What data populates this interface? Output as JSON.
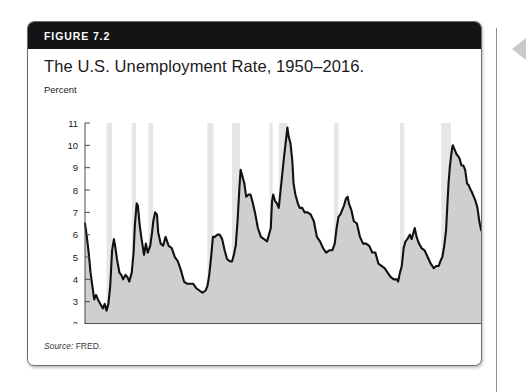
{
  "figure": {
    "badge_label": "FIGURE 7.2",
    "title": "The U.S. Unemployment Rate, 1950–2016.",
    "source_word": "Source:",
    "source_text": " FRED."
  },
  "colors": {
    "header_bar": "#141414",
    "card_border": "#6e6e6e",
    "line": "#111111",
    "area_fill": "#cfcfcf",
    "recession_band": "#e6e6e6",
    "axis": "#4a4a4a",
    "page_background": "#ffffff",
    "edge_arrow": "#c9c9c9"
  },
  "chart_data": {
    "type": "area",
    "title": "The U.S. Unemployment Rate, 1950–2016.",
    "xlabel": "Year",
    "ylabel": "Percent",
    "ylim": [
      2,
      11
    ],
    "xlim": [
      1950,
      2016
    ],
    "grid": false,
    "legend": "none",
    "ytick_labels": [
      "2",
      "3",
      "4",
      "5",
      "6",
      "7",
      "8",
      "9",
      "10",
      "11"
    ],
    "ytick_values": [
      2,
      3,
      4,
      5,
      6,
      7,
      8,
      9,
      10,
      11
    ],
    "xtick_labels": [
      "1950",
      "1960",
      "1970",
      "1980",
      "1990",
      "2000",
      "2010"
    ],
    "xtick_values": [
      1950,
      1960,
      1970,
      1980,
      1990,
      2000,
      2010
    ],
    "series": [
      {
        "name": "U.S. Unemployment Rate",
        "x": [
          1950.0,
          1950.3,
          1950.6,
          1950.9,
          1951.2,
          1951.5,
          1951.8,
          1952.1,
          1952.5,
          1952.9,
          1953.2,
          1953.5,
          1953.8,
          1954.1,
          1954.4,
          1954.7,
          1954.9,
          1955.2,
          1955.6,
          1955.9,
          1956.2,
          1956.6,
          1956.9,
          1957.2,
          1957.6,
          1957.9,
          1958.1,
          1958.4,
          1958.6,
          1958.9,
          1959.2,
          1959.6,
          1959.9,
          1960.2,
          1960.6,
          1960.9,
          1961.1,
          1961.4,
          1961.7,
          1961.9,
          1962.3,
          1962.7,
          1963.1,
          1963.6,
          1964.1,
          1964.6,
          1965.1,
          1965.6,
          1966.1,
          1966.6,
          1967.1,
          1967.6,
          1968.1,
          1968.6,
          1969.1,
          1969.6,
          1969.9,
          1970.2,
          1970.5,
          1970.8,
          1971.1,
          1971.5,
          1971.9,
          1972.3,
          1972.7,
          1973.1,
          1973.6,
          1973.9,
          1974.2,
          1974.5,
          1974.8,
          1975.1,
          1975.3,
          1975.6,
          1975.9,
          1976.2,
          1976.6,
          1976.9,
          1977.3,
          1977.7,
          1978.1,
          1978.6,
          1979.1,
          1979.6,
          1979.9,
          1980.2,
          1980.4,
          1980.6,
          1980.9,
          1981.2,
          1981.5,
          1981.8,
          1982.1,
          1982.4,
          1982.7,
          1982.9,
          1983.1,
          1983.4,
          1983.7,
          1983.9,
          1984.2,
          1984.6,
          1984.9,
          1985.3,
          1985.7,
          1986.2,
          1986.7,
          1987.2,
          1987.7,
          1988.2,
          1988.7,
          1989.2,
          1989.7,
          1990.2,
          1990.6,
          1990.9,
          1991.2,
          1991.5,
          1991.8,
          1992.1,
          1992.4,
          1992.7,
          1992.9,
          1993.3,
          1993.7,
          1994.2,
          1994.7,
          1995.2,
          1995.7,
          1996.2,
          1996.7,
          1997.2,
          1997.7,
          1998.2,
          1998.7,
          1999.2,
          1999.7,
          2000.2,
          2000.7,
          2000.9,
          2001.2,
          2001.5,
          2001.8,
          2002.1,
          2002.4,
          2002.8,
          2003.1,
          2003.4,
          2003.6,
          2003.9,
          2004.3,
          2004.7,
          2005.2,
          2005.7,
          2006.2,
          2006.7,
          2007.1,
          2007.5,
          2007.9,
          2008.1,
          2008.4,
          2008.7,
          2008.9,
          2009.1,
          2009.3,
          2009.5,
          2009.7,
          2009.8,
          2010.1,
          2010.4,
          2010.7,
          2010.9,
          2011.2,
          2011.5,
          2011.8,
          2012.1,
          2012.4,
          2012.7,
          2012.9,
          2013.2,
          2013.5,
          2013.8,
          2014.1,
          2014.4,
          2014.7,
          2014.9,
          2015.2,
          2015.5,
          2015.8,
          2016.0,
          2016.3,
          2016.6,
          2016.9
        ],
        "y": [
          6.5,
          5.9,
          5.2,
          4.3,
          3.7,
          3.1,
          3.3,
          3.1,
          2.9,
          2.7,
          2.9,
          2.6,
          2.9,
          3.7,
          5.3,
          5.8,
          5.5,
          4.9,
          4.3,
          4.2,
          4.0,
          4.2,
          4.1,
          3.9,
          4.3,
          5.2,
          6.4,
          7.4,
          7.3,
          6.4,
          5.8,
          5.1,
          5.6,
          5.2,
          5.5,
          6.1,
          6.6,
          7.0,
          6.9,
          6.1,
          5.6,
          5.5,
          5.9,
          5.5,
          5.4,
          5.0,
          4.8,
          4.4,
          3.9,
          3.8,
          3.8,
          3.8,
          3.6,
          3.5,
          3.4,
          3.5,
          3.7,
          4.2,
          5.0,
          5.9,
          5.9,
          6.0,
          6.0,
          5.8,
          5.3,
          4.9,
          4.8,
          4.8,
          5.1,
          5.5,
          6.6,
          8.1,
          8.9,
          8.6,
          8.3,
          7.7,
          7.8,
          7.8,
          7.4,
          6.9,
          6.3,
          5.9,
          5.8,
          5.7,
          6.0,
          6.3,
          7.5,
          7.8,
          7.5,
          7.4,
          7.2,
          8.0,
          8.8,
          9.6,
          10.3,
          10.8,
          10.4,
          10.1,
          9.3,
          8.3,
          7.8,
          7.4,
          7.2,
          7.2,
          7.0,
          7.0,
          6.9,
          6.6,
          5.9,
          5.7,
          5.4,
          5.2,
          5.3,
          5.3,
          5.6,
          6.3,
          6.8,
          6.9,
          7.1,
          7.3,
          7.6,
          7.7,
          7.4,
          7.1,
          6.6,
          6.5,
          5.9,
          5.6,
          5.6,
          5.5,
          5.2,
          5.2,
          4.7,
          4.6,
          4.5,
          4.3,
          4.1,
          4.0,
          4.0,
          3.9,
          4.3,
          4.6,
          5.4,
          5.7,
          5.8,
          6.0,
          5.8,
          6.1,
          6.3,
          5.9,
          5.6,
          5.4,
          5.3,
          5.0,
          4.7,
          4.5,
          4.6,
          4.6,
          4.9,
          5.0,
          5.5,
          6.2,
          7.3,
          8.3,
          9.0,
          9.5,
          9.9,
          10.0,
          9.8,
          9.6,
          9.5,
          9.4,
          9.1,
          9.1,
          8.9,
          8.3,
          8.2,
          8.0,
          7.9,
          7.7,
          7.5,
          7.2,
          6.6,
          6.2,
          6.1,
          5.7,
          5.5,
          5.3,
          5.1,
          4.9,
          4.9,
          4.9,
          4.7
        ]
      }
    ],
    "recession_bands": [
      {
        "start": 1953.5,
        "end": 1954.4
      },
      {
        "start": 1957.6,
        "end": 1958.3
      },
      {
        "start": 1960.3,
        "end": 1961.1
      },
      {
        "start": 1969.9,
        "end": 1970.9
      },
      {
        "start": 1973.9,
        "end": 1975.2
      },
      {
        "start": 1980.0,
        "end": 1980.5
      },
      {
        "start": 1981.5,
        "end": 1982.9
      },
      {
        "start": 1990.5,
        "end": 1991.2
      },
      {
        "start": 2001.2,
        "end": 2001.9
      },
      {
        "start": 2007.9,
        "end": 2009.5
      }
    ]
  },
  "icons": {
    "edge_arrow": "triangle-left-icon"
  }
}
